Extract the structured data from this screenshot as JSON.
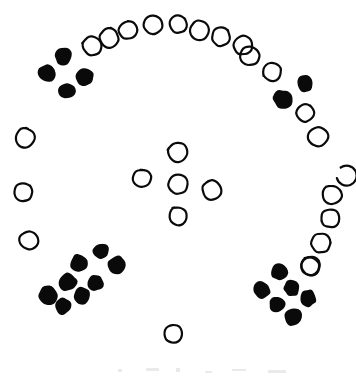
{
  "figure": {
    "width": 356,
    "height": 377,
    "background_color": "#ffffff",
    "ink_color": "#0a0a0a",
    "marker_styles": {
      "open": {
        "name": "open-circle",
        "fill": "none",
        "stroke": "#0a0a0a",
        "stroke_width": 2.2
      },
      "filled": {
        "name": "filled-circle",
        "fill": "#0a0a0a",
        "stroke": "none"
      },
      "broken": {
        "name": "broken-circle",
        "fill": "none",
        "stroke": "#0a0a0a",
        "stroke_width": 2.2
      }
    }
  },
  "chart_data": {
    "type": "scatter",
    "xlabel": "",
    "ylabel": "",
    "xlim": [
      0,
      356
    ],
    "ylim": [
      377,
      0
    ],
    "grid": false,
    "legend": null,
    "series": [
      {
        "name": "open-circle",
        "marker": "open",
        "count": 27,
        "points": [
          [
            92,
            46
          ],
          [
            109,
            38
          ],
          [
            128,
            30
          ],
          [
            153,
            25
          ],
          [
            178,
            24
          ],
          [
            200,
            30
          ],
          [
            221,
            37
          ],
          [
            243,
            45
          ],
          [
            250,
            56
          ],
          [
            272,
            72
          ],
          [
            305,
            113
          ],
          [
            318,
            137
          ],
          [
            332,
            195
          ],
          [
            330,
            218
          ],
          [
            321,
            243
          ],
          [
            311,
            266
          ],
          [
            25,
            138
          ],
          [
            23,
            192
          ],
          [
            29,
            240
          ],
          [
            178,
            152
          ],
          [
            142,
            178
          ],
          [
            178,
            184
          ],
          [
            212,
            190
          ],
          [
            178,
            216
          ],
          [
            310,
            266
          ],
          [
            173,
            334
          ],
          [
            331,
            170
          ]
        ]
      },
      {
        "name": "filled-circle",
        "marker": "filled",
        "count": 20,
        "points": [
          [
            63,
            56
          ],
          [
            47,
            73
          ],
          [
            85,
            77
          ],
          [
            67,
            91
          ],
          [
            305,
            83
          ],
          [
            283,
            99
          ],
          [
            101,
            251
          ],
          [
            117,
            265
          ],
          [
            79,
            263
          ],
          [
            95,
            283
          ],
          [
            68,
            282
          ],
          [
            48,
            295
          ],
          [
            63,
            306
          ],
          [
            82,
            296
          ],
          [
            279,
            272
          ],
          [
            262,
            290
          ],
          [
            292,
            288
          ],
          [
            277,
            304
          ],
          [
            308,
            298
          ],
          [
            293,
            317
          ]
        ]
      }
    ],
    "groups": [
      {
        "name": "top-arc",
        "style": "open",
        "count": 12
      },
      {
        "name": "top-left-cluster",
        "style": "filled",
        "count": 4
      },
      {
        "name": "right-upper-pair",
        "style": "filled",
        "count": 2
      },
      {
        "name": "right-descending-column",
        "style": "open",
        "count": 6
      },
      {
        "name": "left-column",
        "style": "open",
        "count": 3
      },
      {
        "name": "center-quincunx",
        "style": "open",
        "count": 5
      },
      {
        "name": "bottom-left-cluster",
        "style": "filled",
        "count": 8
      },
      {
        "name": "bottom-right-cluster",
        "style": "filled",
        "count": 6
      },
      {
        "name": "bottom-lone-circle",
        "style": "open",
        "count": 1
      }
    ],
    "marker_radius": {
      "open": 9.5,
      "filled": 9.0
    }
  },
  "artifacts": {
    "description": "Faint residual scan smudges along the bottom edge",
    "marks": [
      {
        "x": 118,
        "y": 369,
        "w": 4,
        "h": 3
      },
      {
        "x": 146,
        "y": 368,
        "w": 13,
        "h": 3
      },
      {
        "x": 176,
        "y": 368,
        "w": 4,
        "h": 4
      },
      {
        "x": 205,
        "y": 371,
        "w": 7,
        "h": 2
      },
      {
        "x": 232,
        "y": 369,
        "w": 14,
        "h": 2
      },
      {
        "x": 268,
        "y": 370,
        "w": 18,
        "h": 3
      }
    ]
  }
}
